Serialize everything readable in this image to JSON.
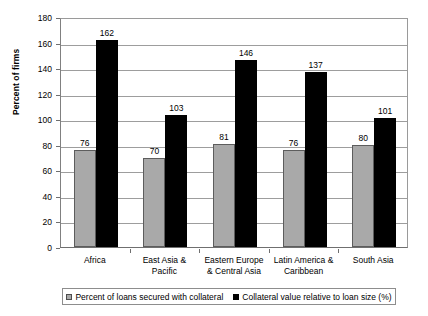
{
  "chart_data": {
    "type": "bar",
    "title": "",
    "xlabel": "",
    "ylabel": "Percent of firms",
    "ylim": [
      0,
      180
    ],
    "ytick_step": 20,
    "yticks": [
      "180",
      "160",
      "140",
      "120",
      "100",
      "80",
      "60",
      "40",
      "20",
      "0"
    ],
    "grid": true,
    "legend_position": "bottom",
    "categories": [
      "Africa",
      "East Asia &\nPacific",
      "Eastern Europe\n& Central Asia",
      "Latin America &\nCaribbean",
      "South Asia"
    ],
    "categories_lines": [
      [
        "Africa"
      ],
      [
        "East Asia &",
        "Pacific"
      ],
      [
        "Eastern Europe",
        "& Central Asia"
      ],
      [
        "Latin America &",
        "Caribbean"
      ],
      [
        "South Asia"
      ]
    ],
    "series": [
      {
        "name": "Percent of loans secured with collateral",
        "color": "#a9a9a9",
        "values": [
          76,
          70,
          81,
          76,
          80
        ],
        "labels": [
          "76",
          "70",
          "81",
          "76",
          "80"
        ]
      },
      {
        "name": "Collateral value relative to loan size (%)",
        "color": "#000000",
        "values": [
          162,
          103,
          146,
          137,
          101
        ],
        "labels": [
          "162",
          "103",
          "146",
          "137",
          "101"
        ]
      }
    ]
  },
  "axis": {
    "y_title": "Percent of firms"
  },
  "legend": {
    "items": [
      {
        "label": "Percent of loans secured with collateral",
        "swatch": "gray-swatch-icon"
      },
      {
        "label": "Collateral value relative to loan size (%)",
        "swatch": "black-swatch-icon"
      }
    ]
  }
}
